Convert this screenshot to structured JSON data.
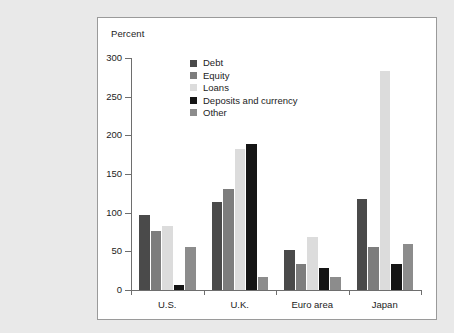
{
  "chart_data": {
    "type": "bar",
    "title": "",
    "subtitle": "",
    "xlabel": "",
    "ylabel": "Percent",
    "ylim": [
      0,
      300
    ],
    "yticks": [
      0,
      50,
      100,
      150,
      200,
      250,
      300
    ],
    "ytick_labels": [
      "0",
      "50",
      "100",
      "150",
      "200",
      "250",
      "300"
    ],
    "grid": false,
    "legend_position": "upper-center",
    "categories": [
      "U.S.",
      "U.K.",
      "Euro area",
      "Japan"
    ],
    "series": [
      {
        "name": "Debt",
        "color": "#4a4a4a",
        "values": [
          97,
          114,
          52,
          118
        ]
      },
      {
        "name": "Equity",
        "color": "#7d7d7d",
        "values": [
          76,
          130,
          34,
          55
        ]
      },
      {
        "name": "Loans",
        "color": "#dcdcdc",
        "values": [
          83,
          182,
          69,
          283
        ]
      },
      {
        "name": "Deposits and currency",
        "color": "#151515",
        "values": [
          6,
          189,
          28,
          34
        ]
      },
      {
        "name": "Other",
        "color": "#8c8c8c",
        "values": [
          55,
          17,
          17,
          59
        ]
      }
    ]
  },
  "figure": {
    "background_color": "#e9e9e9",
    "panel_color": "#ffffff",
    "border_color": "#9a9a9a",
    "axis_color": "#6e6e6e",
    "text_color": "#1c1c1c"
  }
}
